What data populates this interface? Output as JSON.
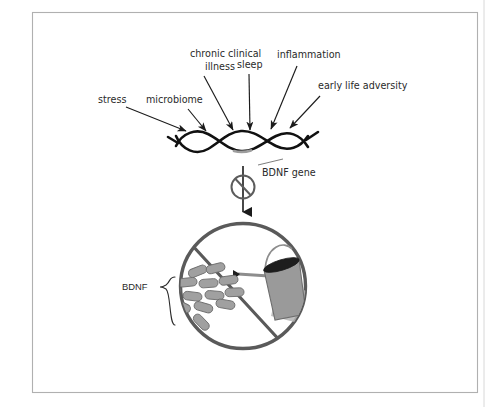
{
  "figure": {
    "background_color": "#ffffff",
    "frame_color": "#b0b0b0",
    "ink_color": "#1b1b1b",
    "cell_stroke_color": "#5a5a5a",
    "vesicle_fill": "#a0a0a0",
    "bucket_fill": "#9a9a9a",
    "gene_highlight_color": "#9d9d9d"
  },
  "influences": [
    {
      "id": "stress",
      "label": "stress"
    },
    {
      "id": "microbiome",
      "label": "microbiome"
    },
    {
      "id": "chronic-clinical-illness",
      "label": "chronic clinical"
    },
    {
      "id": "chronic-clinical-illness-2",
      "label": "illness"
    },
    {
      "id": "sleep",
      "label": "sleep"
    },
    {
      "id": "inflammation",
      "label": "inflammation"
    },
    {
      "id": "early-life-adversity",
      "label": "early life adversity"
    }
  ],
  "annotations": {
    "gene_label": "BDNF gene",
    "protein_label": "BDNF"
  },
  "symbols": {
    "blocked_arrow": "no-entry-slash",
    "dna": "double-helix",
    "cell": "circle",
    "container": "bucket"
  }
}
